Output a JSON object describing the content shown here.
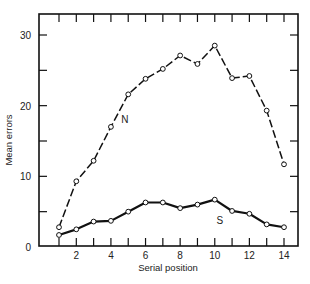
{
  "chart_data": {
    "type": "line",
    "title": "",
    "xlabel": "Serial position",
    "ylabel": "Mean errors",
    "x": [
      1,
      2,
      3,
      4,
      5,
      6,
      7,
      8,
      9,
      10,
      11,
      12,
      13,
      14
    ],
    "xlim": [
      0,
      15
    ],
    "ylim": [
      0,
      32.8
    ],
    "x_ticks": [
      1,
      2,
      3,
      4,
      5,
      6,
      7,
      8,
      9,
      10,
      11,
      12,
      13,
      14
    ],
    "x_tick_labels": [
      "2",
      "4",
      "6",
      "8",
      "10",
      "12",
      "14"
    ],
    "x_tick_label_values": [
      2,
      4,
      6,
      8,
      10,
      12,
      14
    ],
    "y_ticks": [
      0,
      5,
      10,
      15,
      20,
      25,
      30
    ],
    "y_tick_labels": [
      "0",
      "10",
      "20",
      "30"
    ],
    "y_tick_label_values": [
      0,
      10,
      20,
      30
    ],
    "grid": false,
    "legend": "inline labels",
    "series": [
      {
        "name": "N",
        "style": "dashed",
        "marker": "open-circle",
        "values": [
          2.8,
          9.3,
          12.2,
          17.0,
          21.6,
          23.8,
          25.2,
          27.1,
          25.9,
          28.5,
          23.9,
          24.2,
          19.3,
          11.7
        ],
        "label_pos": [
          4.6,
          17.5
        ]
      },
      {
        "name": "S",
        "style": "solid",
        "marker": "open-circle",
        "values": [
          1.7,
          2.5,
          3.6,
          3.7,
          5.0,
          6.3,
          6.3,
          5.5,
          6.0,
          6.7,
          5.1,
          4.7,
          3.2,
          2.8
        ],
        "label_pos": [
          10.1,
          3.3
        ]
      }
    ]
  }
}
